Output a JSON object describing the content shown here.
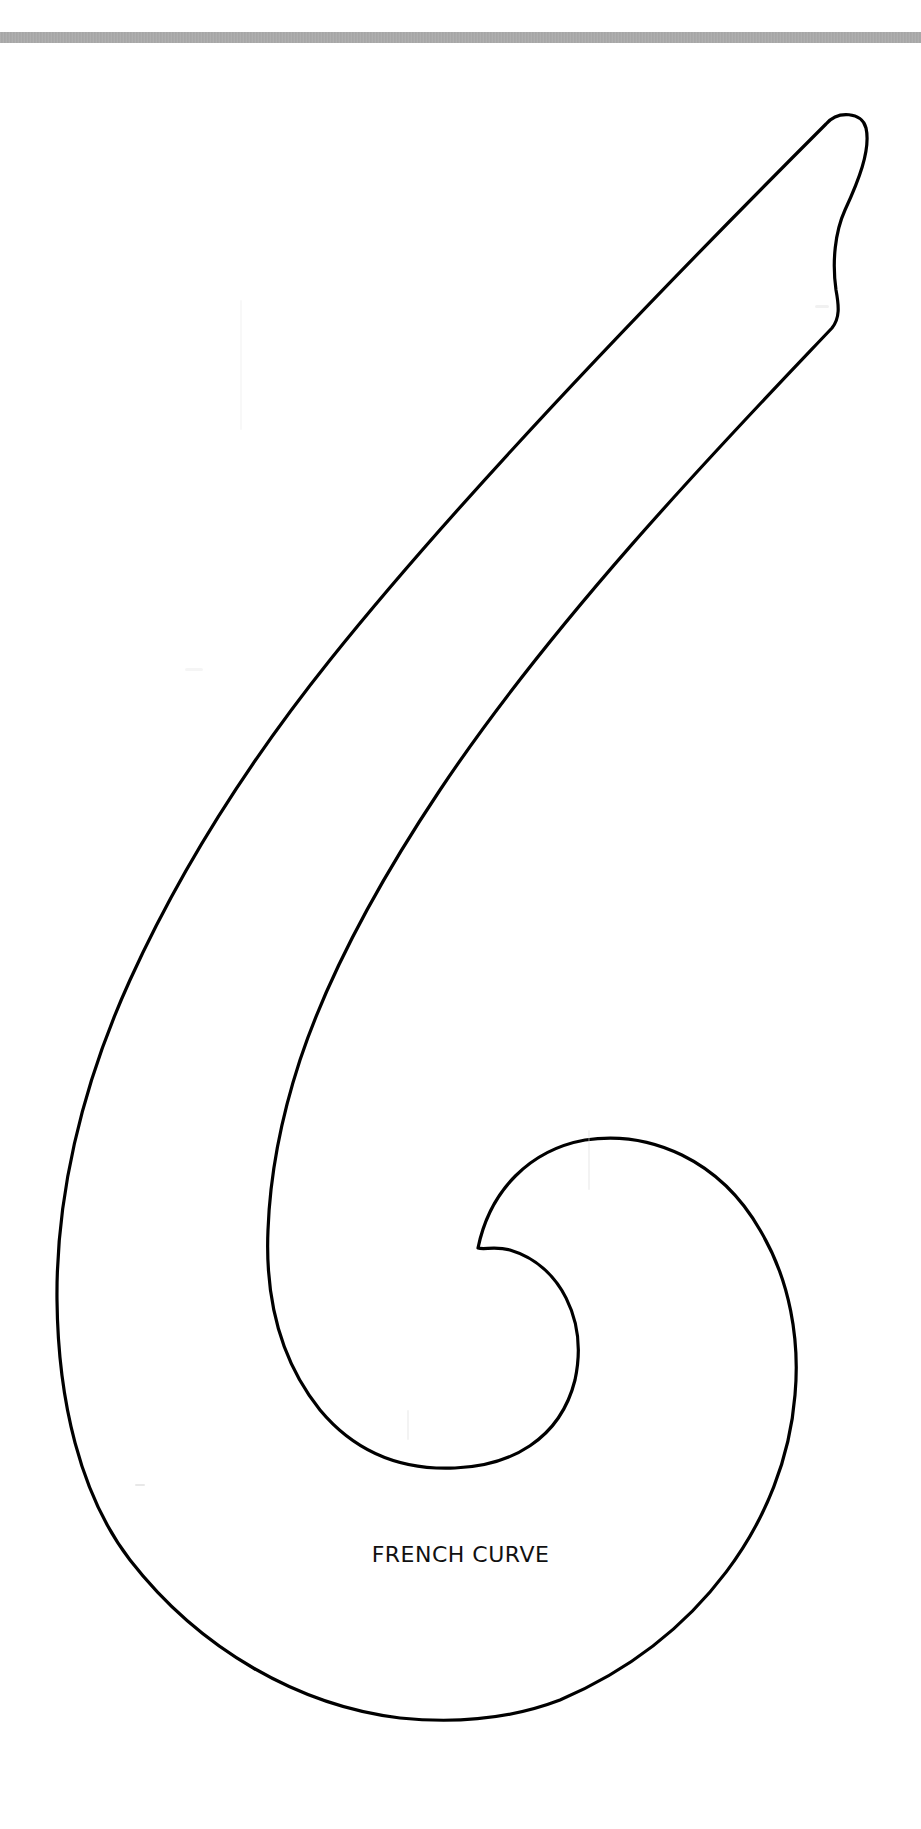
{
  "page": {
    "background": "#ffffff",
    "top_band_color": "#a9a9a9"
  },
  "template": {
    "shape": "french-curve-outline",
    "stroke_color": "#000000",
    "fill_color": "#ffffff",
    "label": "FRENCH CURVE"
  }
}
